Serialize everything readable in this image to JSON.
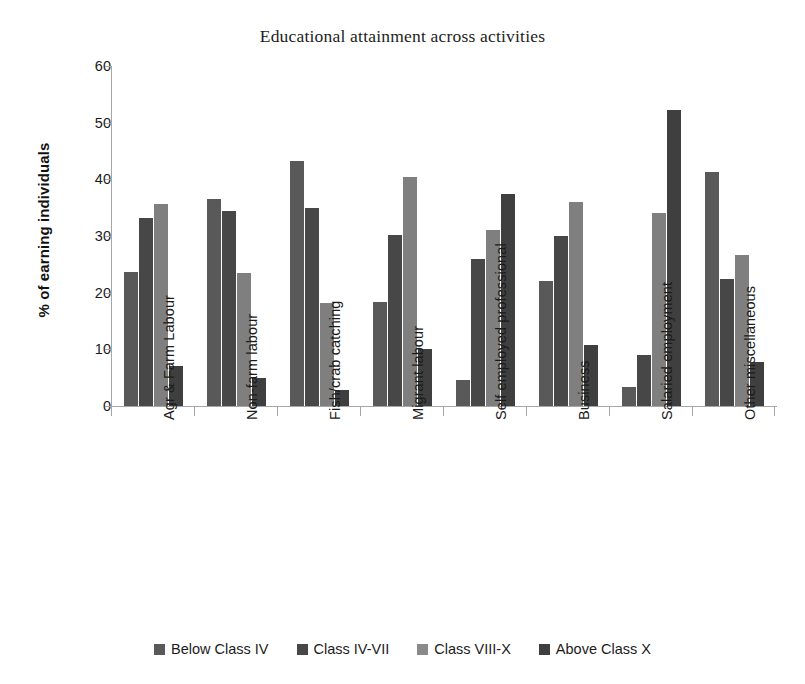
{
  "chart_data": {
    "type": "bar",
    "title": "Educational attainment across activities",
    "xlabel": "",
    "ylabel": "% of earning individuals",
    "ylim": [
      0,
      60
    ],
    "ytick_step": 10,
    "yticks": [
      60,
      50,
      40,
      30,
      20,
      10,
      0
    ],
    "grid": false,
    "legend_position": "bottom",
    "categories": [
      "Agr & Farm Labour",
      "Non-farm labour",
      "Fish/crab catching",
      "Migrant labour",
      "Self employed professional",
      "Business",
      "Salaried employment",
      "Other miscellaneous"
    ],
    "series": [
      {
        "name": "Below Class IV",
        "color": "#595959",
        "values": [
          23.7,
          36.5,
          43.2,
          18.3,
          4.6,
          22.0,
          3.4,
          41.3
        ]
      },
      {
        "name": "Class IV-VII",
        "color": "#474747",
        "values": [
          33.2,
          34.5,
          35.0,
          30.2,
          26.0,
          30.0,
          9.0,
          22.5
        ]
      },
      {
        "name": "Class VIII-X",
        "color": "#7f7f7f",
        "values": [
          35.6,
          23.4,
          18.2,
          40.5,
          31.0,
          36.0,
          34.0,
          26.7
        ]
      },
      {
        "name": "Above Class X",
        "color": "#3f3f3f",
        "values": [
          7.0,
          5.0,
          2.8,
          10.0,
          37.5,
          10.8,
          52.2,
          7.8
        ]
      }
    ]
  },
  "legend": {
    "items": [
      {
        "label": "Below Class IV",
        "color": "#595959"
      },
      {
        "label": "Class IV-VII",
        "color": "#474747"
      },
      {
        "label": "Class VIII-X",
        "color": "#8a8a8a"
      },
      {
        "label": "Above Class X",
        "color": "#3f3f3f"
      }
    ]
  }
}
